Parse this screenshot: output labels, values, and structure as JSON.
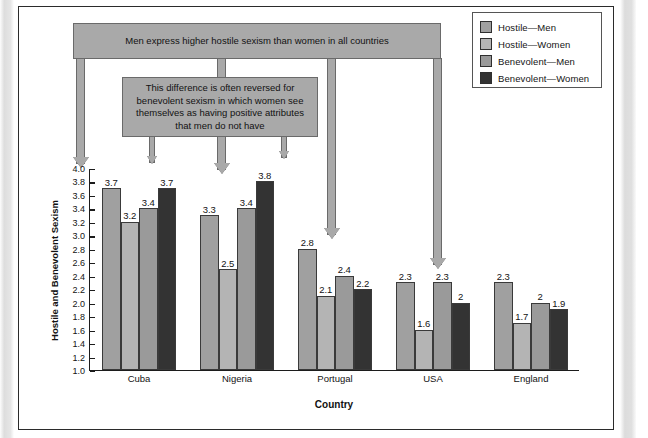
{
  "legend": {
    "items": [
      {
        "label": "Hostile—Men",
        "color": "#a0a0a0"
      },
      {
        "label": "Hostile—Women",
        "color": "#b4b4b4"
      },
      {
        "label": "Benevolent—Men",
        "color": "#9a9a9a"
      },
      {
        "label": "Benevolent—Women",
        "color": "#333333"
      }
    ]
  },
  "callouts": {
    "top": "Men express higher hostile sexism than women in all countries",
    "second": "This difference is often reversed for benevolent sexism in which women see themselves as having positive attributes that men do not have"
  },
  "chart_data": {
    "type": "bar",
    "title": "",
    "xlabel": "Country",
    "ylabel": "Hostile and Benevolent Sexism",
    "categories": [
      "Cuba",
      "Nigeria",
      "Portugal",
      "USA",
      "England"
    ],
    "series": [
      {
        "name": "Hostile—Men",
        "color": "#a0a0a0",
        "values": [
          3.7,
          3.3,
          2.8,
          2.3,
          2.3
        ]
      },
      {
        "name": "Hostile—Women",
        "color": "#b4b4b4",
        "values": [
          3.2,
          2.5,
          2.1,
          1.6,
          1.7
        ]
      },
      {
        "name": "Benevolent—Men",
        "color": "#9a9a9a",
        "values": [
          3.4,
          3.4,
          2.4,
          2.3,
          2.0
        ]
      },
      {
        "name": "Benevolent—Women",
        "color": "#333333",
        "values": [
          3.7,
          3.8,
          2.2,
          2.0,
          1.9
        ]
      }
    ],
    "value_labels": [
      [
        "3.7",
        "3.2",
        "3.4",
        "3.7"
      ],
      [
        "3.3",
        "2.5",
        "3.4",
        "3.8"
      ],
      [
        "2.8",
        "2.1",
        "2.4",
        "2.2"
      ],
      [
        "2.3",
        "1.6",
        "2.3",
        "2"
      ],
      [
        "2.3",
        "1.7",
        "2",
        "1.9"
      ]
    ],
    "ylim": [
      1.0,
      4.0
    ],
    "yticks": [
      "1.0",
      "1.2",
      "1.4",
      "1.6",
      "1.8",
      "2.0",
      "2.2",
      "2.4",
      "2.6",
      "2.8",
      "3.0",
      "3.2",
      "3.4",
      "3.6",
      "3.8",
      "4.0"
    ],
    "grid": false,
    "legend_position": "top-right"
  }
}
